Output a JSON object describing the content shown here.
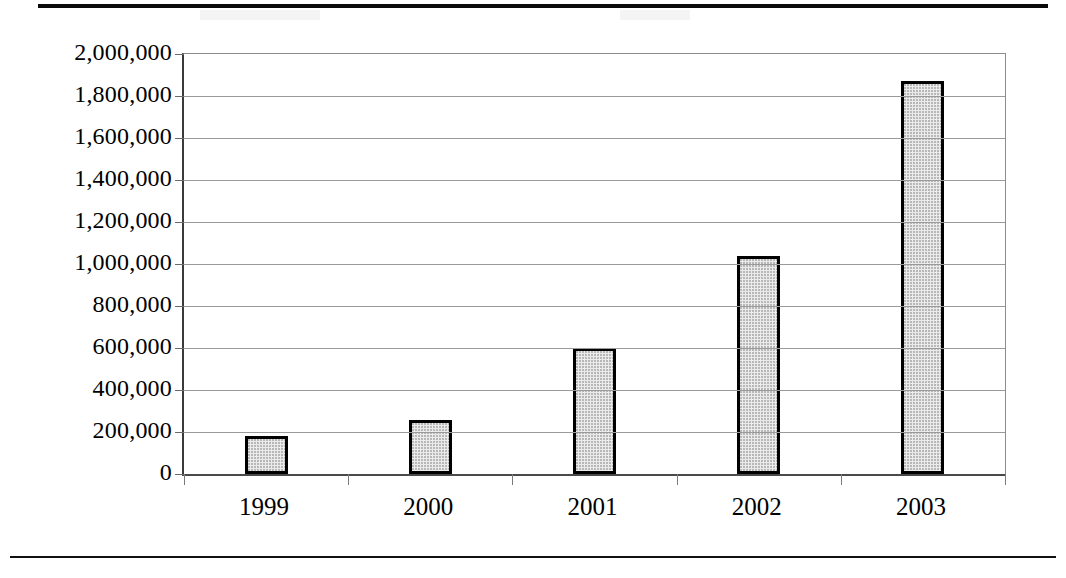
{
  "chart_data": {
    "type": "bar",
    "title": "",
    "subtitle": "",
    "xlabel": "",
    "ylabel": "",
    "categories": [
      "1999",
      "2000",
      "2001",
      "2002",
      "2003"
    ],
    "values": [
      180000,
      255000,
      600000,
      1040000,
      1870000
    ],
    "series": [
      {
        "name": "",
        "values": [
          180000,
          255000,
          600000,
          1040000,
          1870000
        ]
      }
    ],
    "ylim": [
      0,
      2000000
    ],
    "ytick_values": [
      0,
      200000,
      400000,
      600000,
      800000,
      1000000,
      1200000,
      1400000,
      1600000,
      1800000,
      2000000
    ],
    "ytick_labels": [
      "2,000,000",
      "1,800,000",
      "1,600,000",
      "1,400,000",
      "1,200,000",
      "1,000,000",
      "800,000",
      "600,000",
      "400,000",
      "200,000",
      "0"
    ],
    "grid": true,
    "grid_axis": "y",
    "legend": false,
    "legend_position": "none",
    "bar_fill_color": "#ebebeb",
    "bar_border_color": "#000000",
    "gridline_color": "#9a9a9a",
    "axis_color": "#3a3a3a",
    "background_color": "#ffffff"
  }
}
